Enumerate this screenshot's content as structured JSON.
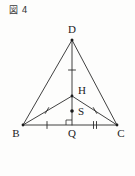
{
  "figure": {
    "caption": "図 4",
    "width": 135,
    "height": 176,
    "background_color": "#fdfdfc",
    "stroke_color": "#2b2b2b"
  },
  "diagram": {
    "type": "geometry-figure",
    "points": {
      "D": {
        "label": "D",
        "x": 72,
        "y": 40
      },
      "B": {
        "label": "B",
        "x": 23,
        "y": 125
      },
      "C": {
        "label": "C",
        "x": 117,
        "y": 125
      },
      "Q": {
        "label": "Q",
        "x": 72,
        "y": 125
      },
      "H": {
        "label": "H",
        "x": 72,
        "y": 96
      },
      "S": {
        "label": "S",
        "x": 72,
        "y": 111
      }
    },
    "labels": [
      {
        "name": "label-D",
        "text": "D",
        "x": 72,
        "y": 33
      },
      {
        "name": "label-B",
        "text": "B",
        "x": 16,
        "y": 137
      },
      {
        "name": "label-C",
        "text": "C",
        "x": 120,
        "y": 137
      },
      {
        "name": "label-Q",
        "text": "Q",
        "x": 72,
        "y": 137
      },
      {
        "name": "label-H",
        "text": "H",
        "x": 80,
        "y": 93
      },
      {
        "name": "label-S",
        "text": "S",
        "x": 80,
        "y": 113
      }
    ],
    "segments": [
      {
        "name": "segment-BD",
        "from": "B",
        "to": "D"
      },
      {
        "name": "segment-DC",
        "from": "D",
        "to": "C"
      },
      {
        "name": "segment-BC",
        "from": "B",
        "to": "C"
      },
      {
        "name": "segment-DQ",
        "from": "D",
        "to": "Q"
      },
      {
        "name": "segment-BH",
        "from": "B",
        "to": "H"
      },
      {
        "name": "segment-HC",
        "from": "H",
        "to": "C"
      }
    ],
    "tick_marks": [
      {
        "name": "tick-on-DH",
        "segment": "segment-DQ",
        "count": 1,
        "x": 72,
        "y": 70
      },
      {
        "name": "tick-on-BH",
        "segment": "segment-BH",
        "count": 1,
        "x": 47,
        "y": 110
      },
      {
        "name": "tick-on-HC",
        "segment": "segment-HC",
        "count": 1,
        "x": 95,
        "y": 110
      },
      {
        "name": "tick-on-BQ",
        "segment": "segment-BC",
        "count": 1,
        "x": 47,
        "y": 125
      },
      {
        "name": "tick-on-QC",
        "segment": "segment-BC",
        "count": 2,
        "x": 95,
        "y": 125
      }
    ],
    "right_angle": {
      "name": "right-angle-marker-at-Q",
      "at": "Q",
      "size": 5
    },
    "dots": [
      {
        "name": "dot-D",
        "at": "D"
      },
      {
        "name": "dot-B",
        "at": "B"
      },
      {
        "name": "dot-C",
        "at": "C"
      },
      {
        "name": "dot-H",
        "at": "H"
      },
      {
        "name": "dot-S",
        "at": "S"
      }
    ]
  }
}
